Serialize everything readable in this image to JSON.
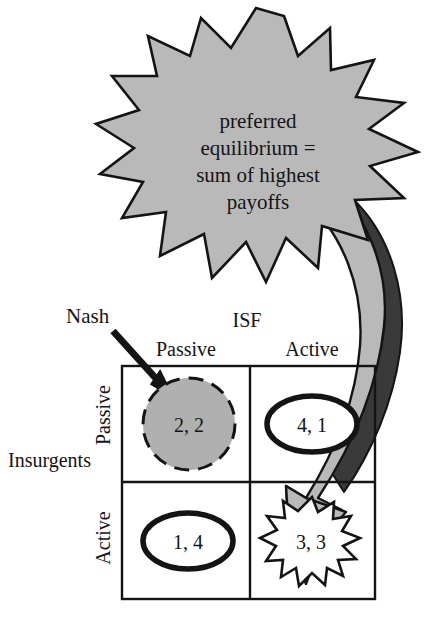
{
  "figure": {
    "type": "payoff-matrix-diagram",
    "callout": {
      "shape": "starburst",
      "fill_color": "#b9b9b9",
      "border_color": "#141414",
      "lines": [
        "preferred",
        "equilibrium =",
        "sum of highest",
        "payoffs"
      ]
    },
    "annotation": {
      "label": "Nash",
      "arrow": "straight-arrow-down-right",
      "points_to": "passive-passive-cell"
    },
    "arrow_ribbon": {
      "shape": "curved-bent-arrow",
      "fill_color": "#b9b9b9",
      "shadow_color": "#3a3a3a",
      "border_color": "#141414",
      "points_to": "active-active-cell"
    },
    "matrix": {
      "column_player": "ISF",
      "row_player": "Insurgents",
      "column_headers": [
        "Passive",
        "Active"
      ],
      "row_headers": [
        "Passive",
        "Active"
      ],
      "cells": [
        {
          "row": "Passive",
          "col": "Passive",
          "payoff": "2, 2",
          "marker": "dashed-circle",
          "fill_color": "#b0b0b0",
          "border_style": "dashed"
        },
        {
          "row": "Passive",
          "col": "Active",
          "payoff": "4, 1",
          "marker": "ellipse",
          "fill_color": "#ffffff",
          "border_style": "solid"
        },
        {
          "row": "Active",
          "col": "Passive",
          "payoff": "1, 4",
          "marker": "ellipse",
          "fill_color": "#ffffff",
          "border_style": "solid"
        },
        {
          "row": "Active",
          "col": "Active",
          "payoff": "3, 3",
          "marker": "starburst",
          "fill_color": "#ffffff",
          "border_style": "solid"
        }
      ]
    }
  }
}
